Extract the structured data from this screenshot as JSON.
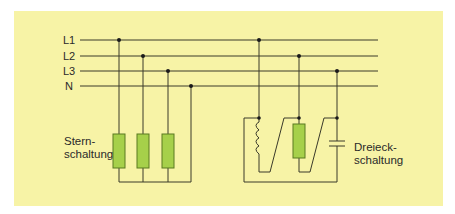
{
  "diagram": {
    "type": "three-phase circuit connections",
    "conductors": [
      {
        "id": "L1",
        "label": "L1"
      },
      {
        "id": "L2",
        "label": "L2"
      },
      {
        "id": "L3",
        "label": "L3"
      },
      {
        "id": "N",
        "label": "N"
      }
    ],
    "star": {
      "label_line1": "Stern-",
      "label_line2": "schaltung",
      "components": [
        "resistor",
        "resistor",
        "resistor"
      ],
      "connected_to": [
        "L1",
        "L2",
        "L3",
        "N"
      ]
    },
    "delta": {
      "label_line1": "Dreieck-",
      "label_line2": "schaltung",
      "components": [
        "inductor",
        "resistor",
        "capacitor"
      ],
      "connected_to": [
        "L1",
        "L2",
        "L3"
      ]
    },
    "colors": {
      "background": "#f7f3a6",
      "resistor_fill": "#a6d04a",
      "resistor_stroke": "#5a7a20",
      "line": "#3a3a2a"
    }
  }
}
